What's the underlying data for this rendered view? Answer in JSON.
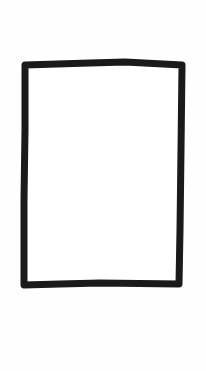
{
  "sketch": {
    "shape": "rectangle",
    "stroke_color": "#1a1a1a",
    "fill_color": "#ffffff",
    "background_color": "#fefefe",
    "stroke_width": 7,
    "points": "25,65 90,63 125,62 182,65 181,150 180,230 179,284 100,283 60,284 24,285 24,200 25,130"
  }
}
